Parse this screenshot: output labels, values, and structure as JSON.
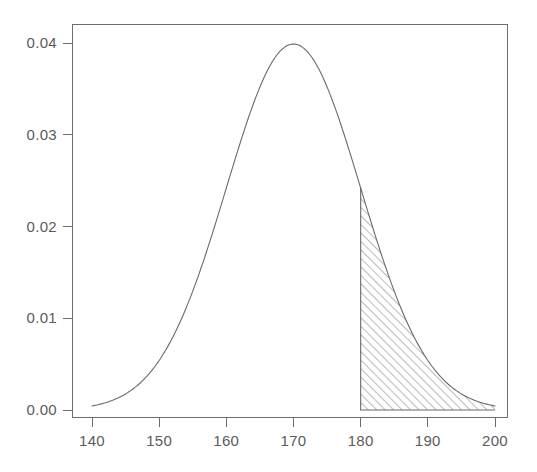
{
  "chart_data": {
    "type": "line",
    "title": "",
    "subtitle": "",
    "xlabel": "",
    "ylabel": "",
    "xlim": [
      140,
      200
    ],
    "ylim": [
      0.0,
      0.0415
    ],
    "grid": false,
    "legend": null,
    "x_ticks": [
      140,
      150,
      160,
      170,
      180,
      190,
      200
    ],
    "x_tick_labels": [
      "140",
      "150",
      "160",
      "170",
      "180",
      "190",
      "200"
    ],
    "y_ticks": [
      0.0,
      0.01,
      0.02,
      0.03,
      0.04
    ],
    "y_tick_labels": [
      "0.00",
      "0.01",
      "0.02",
      "0.03",
      "0.04"
    ],
    "distribution": {
      "family": "normal",
      "mean": 170,
      "sd": 10,
      "peak_x": 170,
      "peak_y": 0.0399
    },
    "series": [
      {
        "name": "normal density",
        "x": [
          140,
          142,
          144,
          146,
          148,
          150,
          152,
          154,
          156,
          158,
          160,
          162,
          164,
          166,
          168,
          170,
          172,
          174,
          176,
          178,
          180,
          182,
          184,
          186,
          188,
          190,
          192,
          194,
          196,
          198,
          200
        ],
        "values": [
          0.0004,
          0.0008,
          0.0014,
          0.0022,
          0.0035,
          0.0054,
          0.0079,
          0.0111,
          0.015,
          0.0194,
          0.0242,
          0.029,
          0.0333,
          0.0368,
          0.0392,
          0.0399,
          0.0392,
          0.0368,
          0.0333,
          0.029,
          0.0242,
          0.0194,
          0.015,
          0.0111,
          0.0079,
          0.0054,
          0.0035,
          0.0022,
          0.0014,
          0.0008,
          0.0004
        ]
      }
    ],
    "shaded_region": {
      "label": "upper tail",
      "style": "diagonal-hatch",
      "hatch_angle_deg": 45,
      "x_from": 180,
      "x_to": 200,
      "y_at_x_from": 0.0242,
      "y_at_x_to": 0.0004
    },
    "annotations": []
  },
  "figure": {
    "background_color": "#ffffff",
    "axis_color": "#6e6e6e",
    "curve_color": "#6a6a6a",
    "hatch_color": "#808080",
    "tick_label_color": "#5b5b5b"
  }
}
